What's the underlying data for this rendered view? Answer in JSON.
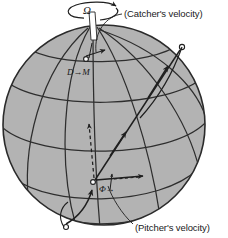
{
  "figure": {
    "background_color": "#ffffff",
    "sphere": {
      "name": "globe",
      "fill_color": "#b3b3b3",
      "outline_color": "#2b2b2b",
      "center_x": 104,
      "center_y": 125,
      "radius_x": 101,
      "radius_y": 100,
      "graticule_color": "#2e2e2e"
    },
    "spin_axis": {
      "label": "Ω",
      "rod_color": "#ffffff",
      "rod_outline": "#333333",
      "rotation_arrow_direction": "counterclockwise"
    },
    "markers": [
      {
        "name": "catcher-position",
        "label": "D→M",
        "x": 86,
        "y": 61
      },
      {
        "name": "pitcher-position",
        "label": "Φ→",
        "x": 96,
        "y": 182
      },
      {
        "name": "trajectory-end-upper-right",
        "x": 183,
        "y": 47
      },
      {
        "name": "trajectory-start-bottom",
        "x": 67,
        "y": 226
      }
    ],
    "labels": {
      "catcher_velocity": "(Catcher's velocity)",
      "pitcher_velocity": "(Pitcher's velocity)"
    },
    "arrows": [
      {
        "name": "catcher-velocity-arrow",
        "style": "solid"
      },
      {
        "name": "pitcher-velocity-arrow",
        "style": "solid"
      },
      {
        "name": "deflection-arrow",
        "style": "dashed"
      },
      {
        "name": "ball-trajectory-arrow",
        "style": "solid"
      },
      {
        "name": "meridian-motion-arrow",
        "style": "solid"
      }
    ]
  }
}
